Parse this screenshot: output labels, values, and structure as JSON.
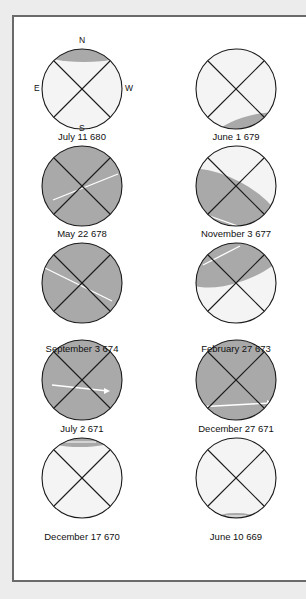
{
  "compass": {
    "n": "N",
    "e": "E",
    "w": "W",
    "s": "S"
  },
  "colors": {
    "shadow": "#a9a9a9",
    "disc": "#f4f4f4",
    "path": "#ffffff",
    "line": "#1a1a1a"
  },
  "panels": [
    {
      "label": "July 11 680"
    },
    {
      "label": "June 1 679"
    },
    {
      "label": "May 22 678"
    },
    {
      "label": "November 3 677"
    },
    {
      "label": "September 3 674"
    },
    {
      "label": "February 27 673"
    },
    {
      "label": "July 2 671"
    },
    {
      "label": "December 27 671"
    },
    {
      "label": "December 17 670"
    },
    {
      "label": "June 10 669"
    }
  ]
}
